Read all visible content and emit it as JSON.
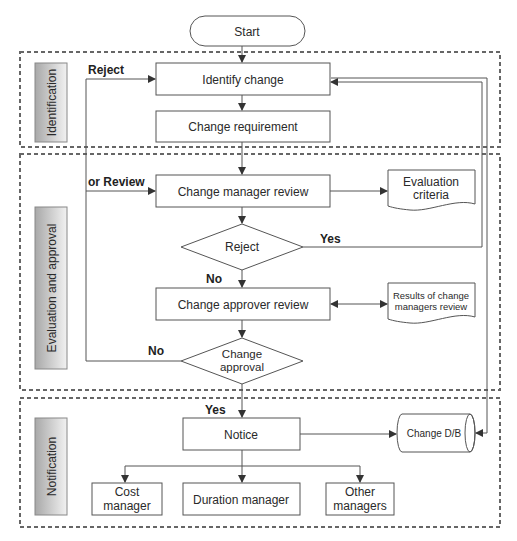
{
  "diagram": {
    "start": {
      "label": "Start"
    },
    "phases": [
      {
        "id": "identification",
        "label": "Identification"
      },
      {
        "id": "evaluation",
        "label": "Evaluation and approval"
      },
      {
        "id": "notification",
        "label": "Notification"
      }
    ],
    "nodes": {
      "identify_change": "Identify change",
      "change_requirement": "Change requirement",
      "change_manager_review": "Change manager review",
      "evaluation_criteria": [
        "Evaluation",
        "criteria"
      ],
      "reject": "Reject",
      "change_approver_review": "Change approver review",
      "results_review": [
        "Results of change",
        "managers review"
      ],
      "change_approval": [
        "Change",
        "approval"
      ],
      "notice": "Notice",
      "change_db": "Change D/B",
      "cost_manager": [
        "Cost",
        "manager"
      ],
      "duration_manager": "Duration manager",
      "other_managers": [
        "Other",
        "managers"
      ]
    },
    "edge_labels": {
      "reject": "Reject",
      "or_review": "or Review",
      "yes_reject": "Yes",
      "no_reject": "No",
      "no_approval": "No",
      "yes_approval": "Yes"
    },
    "colors": {
      "stroke": "#555555",
      "dash": "#666666",
      "phase_dark": "#a8a8a8",
      "phase_light": "#f2f2f2"
    }
  }
}
